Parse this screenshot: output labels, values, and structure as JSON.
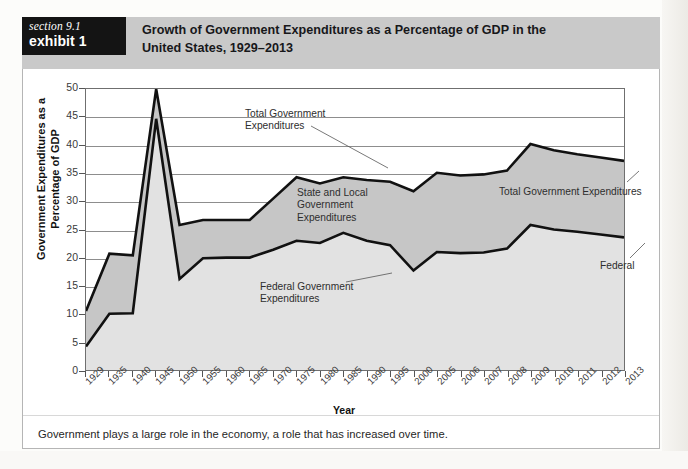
{
  "header": {
    "section_label": "section 9.1",
    "exhibit_label": "exhibit 1",
    "title_line1": "Growth of Government Expenditures as a Percentage of GDP in the",
    "title_line2": "United States, 1929–2013"
  },
  "caption": "Government plays a large role in the economy, a role that has increased over time.",
  "annotations": {
    "total_left": "Total Government\nExpenditures",
    "state_local": "State and Local\nGovernment\nExpenditures",
    "federal_left": "Federal Government\nExpenditures",
    "total_right": "Total Government Expenditures",
    "federal_right": "Federal"
  },
  "colors": {
    "tag_background": "#141414",
    "header_band": "#c9c9c9",
    "total_area_fill": "#c6c6c6",
    "federal_area_fill": "#e2e2e2",
    "line_stroke": "#111111",
    "grid": "#8d8d8d"
  },
  "chart_data": {
    "type": "area",
    "title": "Growth of Government Expenditures as a Percentage of GDP in the United States, 1929–2013",
    "xlabel": "Year",
    "ylabel": "Government Expenditures as a Percentage of GDP",
    "ylim": [
      0,
      50
    ],
    "yticks": [
      0,
      5,
      10,
      15,
      20,
      25,
      30,
      35,
      40,
      45,
      50
    ],
    "grid": true,
    "legend": "annotated-inline",
    "categories": [
      "1929",
      "1935",
      "1940",
      "1945",
      "1950",
      "1955",
      "1960",
      "1965",
      "1970",
      "1975",
      "1980",
      "1985",
      "1990",
      "1995",
      "2000",
      "2005",
      "2006",
      "2007",
      "2008",
      "2009",
      "2010",
      "2011",
      "2012",
      "2013"
    ],
    "series": [
      {
        "name": "Total Government Expenditures",
        "values": [
          10.5,
          20.7,
          20.4,
          50.0,
          25.8,
          26.7,
          26.7,
          26.7,
          30.5,
          34.3,
          33.2,
          34.3,
          33.8,
          33.5,
          31.8,
          35.1,
          34.6,
          34.8,
          35.5,
          40.2,
          39.1,
          38.4,
          37.8,
          37.2
        ]
      },
      {
        "name": "Federal Government Expenditures",
        "values": [
          4.2,
          10.0,
          10.1,
          44.7,
          16.2,
          19.9,
          20.0,
          20.0,
          21.4,
          23.0,
          22.6,
          24.4,
          23.0,
          22.2,
          17.7,
          21.0,
          20.8,
          20.9,
          21.6,
          25.8,
          25.0,
          24.6,
          24.1,
          23.6
        ]
      }
    ]
  }
}
